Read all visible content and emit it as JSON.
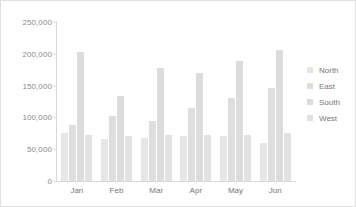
{
  "chart_data": {
    "type": "bar",
    "title": "",
    "subtitle": "",
    "xlabel": "",
    "ylabel": "",
    "categories": [
      "Jan",
      "Feb",
      "Mar",
      "Apr",
      "May",
      "Jun"
    ],
    "series": [
      {
        "name": "North",
        "color": "#e6e6e6",
        "values": [
          75000,
          66000,
          68000,
          70000,
          70000,
          60000
        ]
      },
      {
        "name": "East",
        "color": "#dedede",
        "values": [
          88000,
          103000,
          95000,
          115000,
          130000,
          147000
        ]
      },
      {
        "name": "South",
        "color": "#dcdcdc",
        "values": [
          203000,
          133000,
          177000,
          170000,
          189000,
          206000
        ]
      },
      {
        "name": "West",
        "color": "#e2e2e2",
        "values": [
          72000,
          70000,
          73000,
          73000,
          72000,
          76000
        ]
      }
    ],
    "ylim": [
      0,
      250000
    ],
    "yticks": [
      0,
      50000,
      100000,
      150000,
      200000,
      250000
    ],
    "ytick_labels": [
      "0",
      "50,000",
      "100,000",
      "150,000",
      "200,000",
      "250,000"
    ],
    "grid": false,
    "legend_position": "right"
  }
}
